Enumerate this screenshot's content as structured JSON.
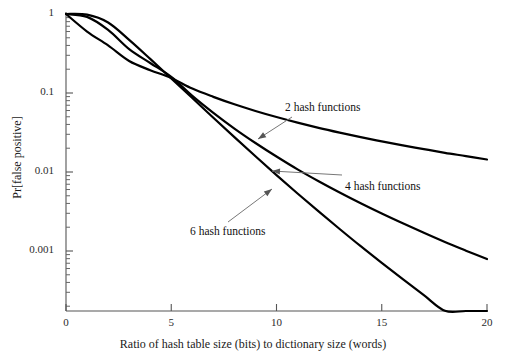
{
  "chart_data": {
    "type": "line",
    "title": "",
    "xlabel": "Ratio of hash table size (bits) to dictionary size (words)",
    "ylabel": "Pr[false positive]",
    "yscale": "log",
    "xlim": [
      0,
      20
    ],
    "ylim": [
      0.0002,
      1
    ],
    "grid": false,
    "legend_position": "inline-annotations",
    "xticks": [
      "0",
      "5",
      "10",
      "15",
      "20"
    ],
    "xtick_values": [
      0,
      5,
      10,
      15,
      20
    ],
    "yticks": [
      "1",
      "0.1",
      "0.01",
      "0.001"
    ],
    "ytick_values": [
      1,
      0.1,
      0.01,
      0.001
    ],
    "series": [
      {
        "name": "2 hash functions",
        "k": 2,
        "x": [
          0,
          1,
          2,
          3,
          4,
          5,
          6,
          7,
          8,
          9,
          10,
          11,
          12,
          13,
          14,
          15,
          16,
          17,
          18,
          19,
          20
        ],
        "values": [
          1.0,
          0.6,
          0.4,
          0.254,
          0.1945,
          0.1548,
          0.1137,
          0.0893,
          0.0719,
          0.0592,
          0.0496,
          0.0421,
          0.0362,
          0.0315,
          0.0276,
          0.0244,
          0.0217,
          0.0195,
          0.0175,
          0.0159,
          0.0144
        ]
      },
      {
        "name": "4 hash functions",
        "k": 4,
        "x": [
          0,
          1,
          2,
          3,
          4,
          5,
          6,
          7,
          8,
          9,
          10,
          11,
          12,
          13,
          14,
          15,
          16,
          17,
          18,
          19,
          20
        ],
        "values": [
          1.0,
          0.92,
          0.63,
          0.36,
          0.24,
          0.16,
          0.092,
          0.0561,
          0.0355,
          0.0233,
          0.0157,
          0.0108,
          0.00764,
          0.0055,
          0.00402,
          0.00298,
          0.00224,
          0.0017,
          0.0013,
          0.00101,
          0.00079
        ]
      },
      {
        "name": "6 hash functions",
        "k": 6,
        "x": [
          0,
          1,
          2,
          3,
          4,
          5,
          6,
          7,
          8,
          9,
          10,
          11,
          12,
          13,
          14,
          15,
          16,
          17,
          18,
          19,
          20
        ],
        "values": [
          1.0,
          0.98,
          0.78,
          0.47,
          0.27,
          0.153,
          0.0864,
          0.0487,
          0.0276,
          0.0158,
          0.00914,
          0.00535,
          0.00317,
          0.0019,
          0.00115,
          0.000707,
          0.00044,
          0.000276,
          0.000175,
          0.000112,
          7.23e-05
        ]
      }
    ],
    "annotations": [
      {
        "text": "2 hash functions",
        "label_x": 285,
        "label_y": 101,
        "arrow_from_x": 292,
        "arrow_from_y": 117,
        "arrow_to_x": 258,
        "arrow_to_y": 139
      },
      {
        "text": "4 hash functions",
        "label_x": 345,
        "label_y": 180,
        "arrow_from_x": 342,
        "arrow_from_y": 175,
        "arrow_to_x": 272,
        "arrow_to_y": 171
      },
      {
        "text": "6 hash functions",
        "label_x": 190,
        "label_y": 225,
        "arrow_from_x": 228,
        "arrow_from_y": 222,
        "arrow_to_x": 272,
        "arrow_to_y": 189
      }
    ],
    "colors": {
      "curve": "#000000",
      "axis": "#555555",
      "text": "#1a1a1a",
      "annotation_arrow": "#777777",
      "background": "#ffffff"
    }
  }
}
